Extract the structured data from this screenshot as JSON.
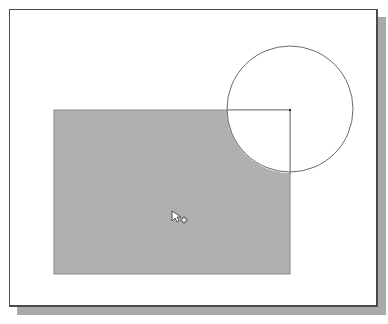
{
  "canvas": {
    "background": "#ffffff",
    "frame_color": "#4a4a4a",
    "shadow_color": "#a9a9a9"
  },
  "shapes": {
    "rectangle": {
      "x": 54,
      "y": 110,
      "width": 236,
      "height": 164,
      "fill": "#b0b0b0",
      "stroke": "#8a8a8a"
    },
    "circle": {
      "cx": 290,
      "cy": 109,
      "r": 63,
      "stroke": "#6a6a6a",
      "fill": "#ffffff"
    },
    "radius_line": {
      "x1": 227,
      "y1": 109,
      "x2": 290,
      "y2": 109
    },
    "center_line": {
      "x1": 290,
      "y1": 109,
      "x2": 290,
      "y2": 174
    }
  },
  "cursor": {
    "type": "arrow-with-plus",
    "x": 172,
    "y": 211
  }
}
